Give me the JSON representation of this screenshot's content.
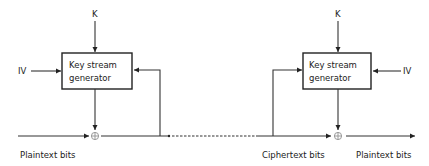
{
  "diagram": {
    "encryptor": {
      "key_label": "K",
      "iv_label": "IV",
      "box_line1": "Key stream",
      "box_line2": "generator",
      "input_label": "Plaintext bits"
    },
    "channel": {
      "output_label": "Ciphertext bits"
    },
    "decryptor": {
      "key_label": "K",
      "iv_label": "IV",
      "box_line1": "Key stream",
      "box_line2": "generator",
      "output_label": "Plaintext bits"
    },
    "colors": {
      "line": "#333333",
      "text": "#222222",
      "background": "#ffffff"
    }
  }
}
